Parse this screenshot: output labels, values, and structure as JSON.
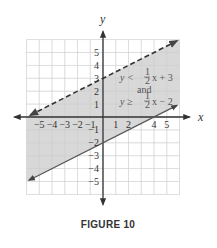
{
  "chart_data": {
    "type": "line",
    "title": "",
    "caption": "FIGURE 10",
    "xlabel": "x",
    "ylabel": "y",
    "xlim": [
      -6,
      6
    ],
    "ylim": [
      -6,
      6
    ],
    "grid": true,
    "x_ticks": [
      -5,
      -4,
      -3,
      -2,
      -1,
      1,
      2,
      4,
      5
    ],
    "x_tick_labels": [
      "−5",
      "−4",
      "−3",
      "−2",
      "−1",
      "1",
      "2",
      "4",
      "5"
    ],
    "y_ticks": [
      5,
      4,
      3,
      2,
      1,
      -1,
      -2,
      -3,
      -4,
      -5
    ],
    "y_tick_labels": [
      "5",
      "4",
      "3",
      "2",
      "1",
      "−1",
      "−2",
      "−3",
      "−4",
      "−5"
    ],
    "series": [
      {
        "name": "y = 1/2 x + 3",
        "style": "dashed",
        "slope": 0.5,
        "intercept": 3,
        "x": [
          -6,
          6
        ],
        "y": [
          0,
          6
        ]
      },
      {
        "name": "y = 1/2 x - 2",
        "style": "solid",
        "slope": 0.5,
        "intercept": -2,
        "x": [
          -6,
          6
        ],
        "y": [
          -5,
          1
        ]
      }
    ],
    "shaded_region": "between lines (y < 1/2 x + 3 and y >= 1/2 x - 2)",
    "annotations": [
      {
        "text": "y < ½x + 3",
        "x": 3,
        "y": 2.8
      },
      {
        "text": "and",
        "x": 3,
        "y": 1.8
      },
      {
        "text": "y ≥ ½x − 2",
        "x": 3,
        "y": 1
      }
    ],
    "colors": {
      "shade": "#d4d4d4",
      "grid": "#e4e4e4",
      "axis": "#333333",
      "line": "#444444",
      "annotation": "#555555"
    }
  },
  "labels": {
    "x_axis": "x",
    "y_axis": "y",
    "ineq1_lhs": "y <",
    "ineq1_rhs": "x + 3",
    "and": "and",
    "ineq2_lhs": "y ≥",
    "ineq2_rhs": "x − 2",
    "half_num": "1",
    "half_den": "2",
    "caption": "FIGURE 10"
  }
}
